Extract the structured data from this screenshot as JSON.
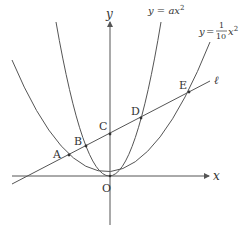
{
  "diagram": {
    "axes": {
      "x_label": "x",
      "y_label": "y",
      "origin_label": "O"
    },
    "curves": [
      {
        "id": "steep-parabola",
        "label_lhs": "y = ",
        "label_rhs": "ax",
        "label_exp": "2"
      },
      {
        "id": "wide-parabola",
        "label_lhs": "y = ",
        "label_num": "1",
        "label_den": "10",
        "label_rhs": "x",
        "label_exp": "2"
      }
    ],
    "line": {
      "label": "ℓ"
    },
    "points": [
      {
        "label": "A"
      },
      {
        "label": "B"
      },
      {
        "label": "C"
      },
      {
        "label": "D"
      },
      {
        "label": "E"
      }
    ],
    "colors": {
      "stroke": "#555555",
      "text": "#333333"
    }
  }
}
